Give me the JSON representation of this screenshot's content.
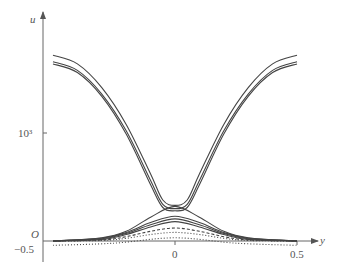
{
  "chart_data": {
    "type": "line",
    "title": "",
    "xlabel": "y",
    "ylabel": "u",
    "origin_label": "O",
    "x_ticks": [
      {
        "value": -0.5,
        "label": "−0.5"
      },
      {
        "value": 0,
        "label": "0"
      },
      {
        "value": 0.5,
        "label": "0.5"
      }
    ],
    "y_ticks": [
      {
        "value": 1000,
        "label": "10³"
      }
    ],
    "xlim": [
      -0.55,
      0.58
    ],
    "ylim": [
      0,
      1760
    ],
    "grid": false,
    "legend": null,
    "series": [
      {
        "name": "outer-1",
        "style": "solid",
        "x": [
          -0.5,
          -0.4,
          -0.3,
          -0.2,
          -0.1,
          -0.05,
          0,
          0.05,
          0.1,
          0.2,
          0.3,
          0.4,
          0.5
        ],
        "y": [
          1720,
          1640,
          1420,
          1080,
          620,
          380,
          330,
          380,
          620,
          1080,
          1420,
          1640,
          1720
        ]
      },
      {
        "name": "outer-2",
        "style": "solid",
        "x": [
          -0.5,
          -0.4,
          -0.3,
          -0.2,
          -0.1,
          -0.05,
          0,
          0.05,
          0.1,
          0.2,
          0.3,
          0.4,
          0.5
        ],
        "y": [
          1660,
          1580,
          1360,
          1020,
          560,
          340,
          300,
          340,
          560,
          1020,
          1360,
          1580,
          1660
        ]
      },
      {
        "name": "outer-3",
        "style": "solid",
        "x": [
          -0.5,
          -0.4,
          -0.3,
          -0.2,
          -0.1,
          -0.05,
          0,
          0.05,
          0.1,
          0.2,
          0.3,
          0.4,
          0.5
        ],
        "y": [
          1640,
          1560,
          1340,
          990,
          520,
          310,
          280,
          310,
          520,
          990,
          1340,
          1560,
          1640
        ]
      },
      {
        "name": "hump-1",
        "style": "solid",
        "x": [
          -0.5,
          -0.3,
          -0.2,
          -0.1,
          0,
          0.1,
          0.2,
          0.3,
          0.5
        ],
        "y": [
          0,
          30,
          90,
          220,
          320,
          220,
          90,
          30,
          0
        ]
      },
      {
        "name": "hump-2",
        "style": "solid",
        "x": [
          -0.5,
          -0.3,
          -0.2,
          -0.1,
          0,
          0.1,
          0.2,
          0.3,
          0.5
        ],
        "y": [
          0,
          25,
          80,
          170,
          230,
          170,
          80,
          25,
          0
        ]
      },
      {
        "name": "hump-3",
        "style": "solid",
        "x": [
          -0.5,
          -0.3,
          -0.2,
          -0.1,
          0,
          0.1,
          0.2,
          0.3,
          0.5
        ],
        "y": [
          0,
          20,
          70,
          150,
          205,
          150,
          70,
          20,
          0
        ]
      },
      {
        "name": "hump-4",
        "style": "solid",
        "x": [
          -0.5,
          -0.3,
          -0.2,
          -0.1,
          0,
          0.1,
          0.2,
          0.3,
          0.5
        ],
        "y": [
          0,
          15,
          60,
          130,
          180,
          130,
          60,
          15,
          0
        ]
      },
      {
        "name": "hump-dashed",
        "style": "dashed",
        "x": [
          -0.5,
          -0.3,
          -0.2,
          -0.1,
          0,
          0.1,
          0.2,
          0.3,
          0.5
        ],
        "y": [
          0,
          10,
          40,
          90,
          120,
          90,
          40,
          10,
          0
        ]
      },
      {
        "name": "hump-dotted",
        "style": "dotted",
        "x": [
          -0.5,
          -0.3,
          -0.2,
          -0.1,
          0,
          0.1,
          0.2,
          0.3,
          0.5
        ],
        "y": [
          0,
          5,
          25,
          60,
          80,
          60,
          25,
          5,
          0
        ]
      },
      {
        "name": "scatter-base",
        "style": "dotted",
        "x": [
          -0.5,
          -0.25,
          0,
          0.25,
          0.5
        ],
        "y": [
          -40,
          -20,
          30,
          -20,
          -40
        ]
      }
    ]
  }
}
